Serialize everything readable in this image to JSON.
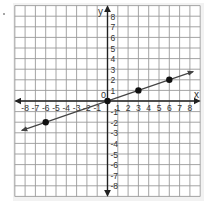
{
  "chart_data": {
    "type": "line",
    "title": "",
    "xlabel": "x",
    "ylabel": "y",
    "origin_label": "0",
    "xlim": [
      -9,
      9
    ],
    "ylim": [
      -9,
      9
    ],
    "grid": true,
    "x_ticks": [
      -8,
      -7,
      -6,
      -5,
      -4,
      -3,
      -2,
      -1,
      1,
      2,
      3,
      4,
      5,
      6,
      7,
      8
    ],
    "y_ticks": [
      8,
      7,
      6,
      5,
      4,
      3,
      2,
      1,
      -1,
      -2,
      -3,
      -4,
      -5,
      -6,
      -7,
      -8
    ],
    "series": [
      {
        "name": "line y = x/3",
        "equation": "y = x/3",
        "line_extent": [
          [
            -8.3,
            -2.77
          ],
          [
            8.3,
            2.77
          ]
        ],
        "arrows_both_ends": true,
        "points": [
          {
            "x": -6,
            "y": -2
          },
          {
            "x": 0,
            "y": 0
          },
          {
            "x": 3,
            "y": 1
          },
          {
            "x": 6,
            "y": 2
          }
        ]
      }
    ]
  },
  "colors": {
    "grid": "#9a9a9a",
    "grid_dark": "#6e6e6e",
    "axis": "#222222",
    "line": "#444444",
    "point": "#111111",
    "label": "#333333",
    "frame_shadow": "#e6e6e6"
  },
  "labels": {
    "x_axis": "x",
    "y_axis": "y",
    "origin": "0"
  }
}
